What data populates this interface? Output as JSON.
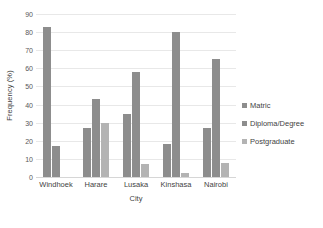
{
  "chart_data": {
    "type": "bar",
    "title": "",
    "xlabel": "City",
    "ylabel": "Frequency (%)",
    "categories": [
      "Windhoek",
      "Harare",
      "Lusaka",
      "Kinshasa",
      "Nairobi"
    ],
    "series": [
      {
        "name": "Matric",
        "values": [
          83,
          27,
          35,
          18,
          27
        ],
        "color": "#8d8d8d"
      },
      {
        "name": "Diploma/Degree",
        "values": [
          17,
          43,
          58,
          80,
          65
        ],
        "color": "#8d8d8d"
      },
      {
        "name": "Postgraduate",
        "values": [
          0,
          30,
          7,
          2,
          8
        ],
        "color": "#b3b3b3"
      }
    ],
    "ylim": [
      0,
      90
    ],
    "yticks": [
      0,
      10,
      20,
      30,
      40,
      50,
      60,
      70,
      80,
      90
    ],
    "ytick_labels": [
      "0",
      "10",
      "20",
      "30",
      "40",
      "50",
      "60",
      "70",
      "80",
      "90"
    ],
    "grid": true,
    "legend_position": "right",
    "grid_color": "#e8e8e8",
    "text_color": "#3f3f3f"
  }
}
